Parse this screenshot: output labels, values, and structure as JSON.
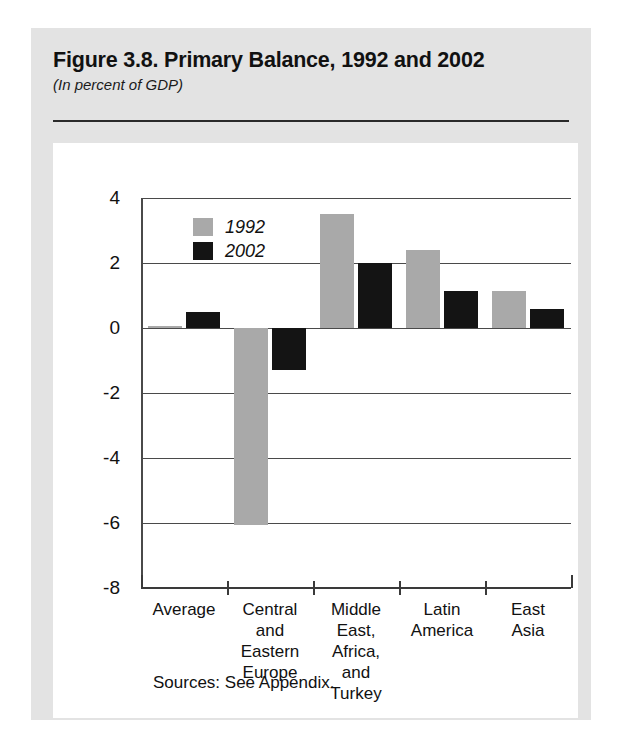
{
  "figure": {
    "title": "Figure 3.8. Primary Balance, 1992 and 2002",
    "subtitle": "(In percent of GDP)",
    "source_note": "Sources: See Appendix."
  },
  "colors": {
    "series_1992": "#a9a9a9",
    "series_2002": "#141414",
    "page_background": "#e3e3e3",
    "card_background": "#ffffff",
    "axis": "#3a3a3a"
  },
  "chart_data": {
    "type": "bar",
    "title": "Figure 3.8. Primary Balance, 1992 and 2002",
    "subtitle": "(In percent of GDP)",
    "xlabel": "",
    "ylabel": "",
    "categories": [
      "Average",
      "Central and Eastern Europe",
      "Middle East, Africa, and Turkey",
      "Latin America",
      "East Asia"
    ],
    "category_label_lines": [
      [
        "Average"
      ],
      [
        "Central",
        "and",
        "Eastern",
        "Europe"
      ],
      [
        "Middle",
        "East,",
        "Africa,",
        "and",
        "Turkey"
      ],
      [
        "Latin",
        "America"
      ],
      [
        "East",
        "Asia"
      ]
    ],
    "series": [
      {
        "name": "1992",
        "color": "#a9a9a9",
        "values": [
          0.05,
          -6.05,
          3.5,
          2.4,
          1.15
        ]
      },
      {
        "name": "2002",
        "color": "#141414",
        "values": [
          0.5,
          -1.3,
          2.0,
          1.15,
          0.6
        ]
      }
    ],
    "ylim": [
      -8,
      4
    ],
    "yticks": [
      4,
      2,
      0,
      -2,
      -4,
      -6,
      -8
    ],
    "ytick_labels": [
      "4",
      "2",
      "0",
      "-2",
      "-4",
      "-6",
      "-8"
    ],
    "grid": true,
    "legend": [
      "1992",
      "2002"
    ],
    "legend_position": "upper-left"
  }
}
